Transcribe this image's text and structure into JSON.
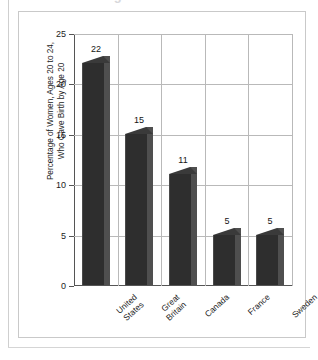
{
  "page": {
    "clipped_heading": "Births to Teenagers"
  },
  "chart_data": {
    "type": "bar",
    "title": "",
    "xlabel": "",
    "ylabel": "Percentage of Women, Ages 20 to 24, Who Gave Birth by Age 20",
    "ylabel_lines": [
      "Percentage of Women, Ages 20 to 24,",
      "Who Gave Birth by Age 20"
    ],
    "categories": [
      "United States",
      "Great Britain",
      "Canada",
      "France",
      "Sweden"
    ],
    "category_lines": [
      [
        "United",
        "States"
      ],
      [
        "Great",
        "Britain"
      ],
      [
        "Canada"
      ],
      [
        "France"
      ],
      [
        "Sweden"
      ]
    ],
    "values": [
      22,
      15,
      11,
      5,
      5
    ],
    "value_labels": [
      "22",
      "15",
      "11",
      "5",
      "5"
    ],
    "ylim": [
      0,
      25
    ],
    "yticks": [
      0,
      5,
      10,
      15,
      20,
      25
    ],
    "ytick_labels": [
      "0",
      "5",
      "10",
      "15",
      "20",
      "25"
    ],
    "grid": true,
    "legend": "none",
    "bar_style": "3d",
    "colors": {
      "bar_front": "#2e2e2e",
      "bar_side": "#4f4f4f",
      "bar_top": "#3a3a3a",
      "grid": "#b9b9b9",
      "axis": "#555555",
      "card_border": "#c9c9c9",
      "background": "#ffffff"
    }
  }
}
